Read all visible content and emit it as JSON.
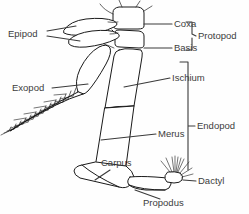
{
  "figure": {
    "background_color": "#fefefe",
    "line_color": "#1a1a1a",
    "text_color": "#3c3c3c"
  },
  "labels": {
    "epipod": "Epipod",
    "exopod": "Exopod",
    "coxa": "Coxa",
    "basis": "Basis",
    "ischium": "Ischium",
    "merus": "Merus",
    "carpus": "Carpus",
    "propodus": "Propodus",
    "dactyl": "Dactyl"
  },
  "groups": {
    "protopod": "Protopod",
    "endopod": "Endopod"
  },
  "parts": [
    {
      "name": "epipod",
      "label": "Epipod",
      "label_x": 8,
      "label_y": 34,
      "side": "left"
    },
    {
      "name": "exopod",
      "label": "Exopod",
      "label_x": 12,
      "label_y": 88,
      "side": "left"
    },
    {
      "name": "coxa",
      "label": "Coxa",
      "label_x": 152,
      "label_y": 24,
      "side": "right"
    },
    {
      "name": "basis",
      "label": "Basis",
      "label_x": 152,
      "label_y": 48,
      "side": "right"
    },
    {
      "name": "ischium",
      "label": "Ischium",
      "label_x": 142,
      "label_y": 81,
      "side": "right"
    },
    {
      "name": "merus",
      "label": "Merus",
      "label_x": 130,
      "label_y": 136,
      "side": "right"
    },
    {
      "name": "carpus",
      "label": "Carpus",
      "label_x": 101,
      "label_y": 163,
      "side": "right"
    },
    {
      "name": "propodus",
      "label": "Propodus",
      "label_x": 143,
      "label_y": 199,
      "side": "right"
    },
    {
      "name": "dactyl",
      "label": "Dactyl",
      "label_x": 172,
      "label_y": 182,
      "side": "right"
    }
  ],
  "group_brackets": [
    {
      "name": "protopod",
      "label": "Protopod",
      "top": 22,
      "bottom": 50,
      "x": 192,
      "label_x": 198,
      "label_y": 36
    },
    {
      "name": "endopod",
      "label": "Endopod",
      "top": 62,
      "bottom": 170,
      "x": 188,
      "label_x": 196,
      "label_y": 126
    }
  ]
}
